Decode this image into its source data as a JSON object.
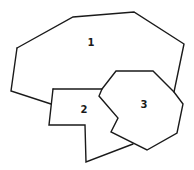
{
  "diagram": {
    "type": "planar-regions-map",
    "regions": [
      {
        "id": "1",
        "label": "1",
        "label_pos": [
          91,
          43
        ]
      },
      {
        "id": "2",
        "label": "2",
        "label_pos": [
          84,
          110
        ]
      },
      {
        "id": "3",
        "label": "3",
        "label_pos": [
          144,
          105
        ]
      }
    ],
    "edges": {
      "region1_outer": "M17,48 L73,17 L134,12 L184,44 L174,92",
      "region1_left": "M17,48 L11,91 L51,104",
      "region2_top": "M53,89 L102,89",
      "region2_left": "M53,89 L49,125 L85,125 L86,162 L133,144",
      "region3": "M102,89 L116,71 L153,71 L174,92 L183,104 L177,133 L147,150 L111,132 L118,118 L99,96 L102,89"
    },
    "stroke_color": "#1a1a1a",
    "background_color": "#ffffff"
  }
}
